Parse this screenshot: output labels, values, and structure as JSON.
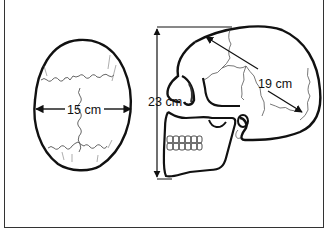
{
  "figure": {
    "type": "skull dimensions diagram",
    "top_view": {
      "label": "15 cm",
      "measure": "width"
    },
    "side_view": {
      "height_label": "23 cm",
      "length_label": "19 cm"
    }
  },
  "colors": {
    "line": "#111111",
    "suture": "#555555",
    "frame": "#333333",
    "background": "#ffffff"
  }
}
